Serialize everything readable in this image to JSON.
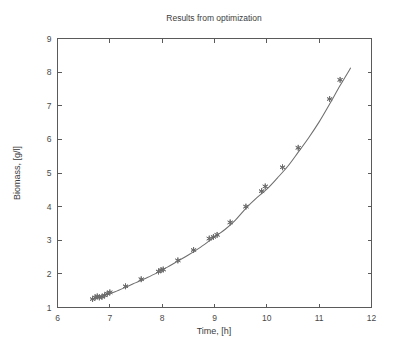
{
  "chart_data": {
    "type": "line",
    "title": "Results from optimization",
    "xlabel": "Time, [h]",
    "ylabel": "Biomass, [g/l]",
    "xlim": [
      6,
      12
    ],
    "ylim": [
      1,
      9
    ],
    "xticks": [
      6,
      7,
      8,
      9,
      10,
      11,
      12
    ],
    "yticks": [
      1,
      2,
      3,
      4,
      5,
      6,
      7,
      8,
      9
    ],
    "xtick_labels": [
      "6",
      "7",
      "8",
      "9",
      "10",
      "11",
      "12"
    ],
    "ytick_labels": [
      "1",
      "2",
      "3",
      "4",
      "5",
      "6",
      "7",
      "8",
      "9"
    ],
    "grid": false,
    "legend": null,
    "legend_position": "none",
    "series": [
      {
        "name": "Model fit",
        "kind": "line",
        "style": "solid",
        "color": "#6e6e6e",
        "x": [
          6.65,
          6.8,
          6.95,
          7.1,
          7.3,
          7.5,
          7.7,
          7.9,
          8.1,
          8.3,
          8.5,
          8.7,
          8.9,
          9.05,
          9.2,
          9.4,
          9.6,
          9.8,
          10.0,
          10.2,
          10.4,
          10.6,
          10.8,
          11.0,
          11.2,
          11.4,
          11.6
        ],
        "y": [
          1.25,
          1.31,
          1.4,
          1.47,
          1.6,
          1.74,
          1.88,
          2.03,
          2.2,
          2.38,
          2.56,
          2.76,
          2.98,
          3.15,
          3.32,
          3.6,
          3.95,
          4.25,
          4.52,
          4.85,
          5.2,
          5.62,
          6.05,
          6.52,
          7.05,
          7.6,
          8.12
        ]
      },
      {
        "name": "Measurements",
        "kind": "scatter",
        "marker": "star",
        "color": "#6a6a6a",
        "x": [
          6.67,
          6.72,
          6.76,
          6.8,
          6.85,
          6.9,
          6.95,
          7.0,
          7.3,
          7.6,
          7.93,
          7.98,
          8.02,
          8.3,
          8.6,
          8.9,
          8.98,
          9.05,
          9.3,
          9.6,
          9.9,
          9.97,
          10.3,
          10.6,
          11.2,
          11.4
        ],
        "y": [
          1.25,
          1.3,
          1.33,
          1.3,
          1.32,
          1.36,
          1.41,
          1.45,
          1.63,
          1.84,
          2.07,
          2.11,
          2.13,
          2.4,
          2.71,
          3.05,
          3.1,
          3.16,
          3.53,
          4.0,
          4.46,
          4.6,
          5.17,
          5.75,
          7.2,
          7.77
        ]
      }
    ]
  },
  "figure": {
    "title": "Results from optimization",
    "axis_color": "#5a5a5a",
    "background": "#ffffff"
  }
}
